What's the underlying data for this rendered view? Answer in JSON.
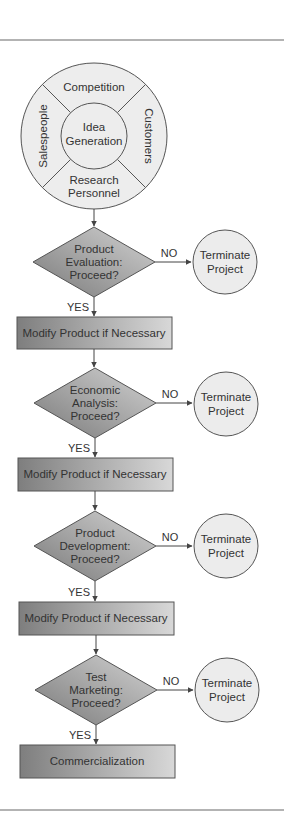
{
  "diagram": {
    "type": "flowchart",
    "colors": {
      "rule": "#9a9a9a",
      "stroke": "#555555",
      "text": "#333333",
      "circle_fill": "#ececec",
      "shape_dark": "#858585",
      "shape_light": "#d4d4d4"
    },
    "idea_wheel": {
      "center": "Idea Generation",
      "center_lines": [
        "Idea",
        "Generation"
      ],
      "segments": {
        "top": "Competition",
        "right": "Customers",
        "bottom_lines": [
          "Research",
          "Personnel"
        ],
        "left": "Salespeople"
      }
    },
    "stages": [
      {
        "decision_lines": [
          "Product",
          "Evaluation:",
          "Proceed?"
        ],
        "no_label": "NO",
        "yes_label": "YES",
        "terminate_lines": [
          "Terminate",
          "Project"
        ],
        "action": "Modify Product if Necessary"
      },
      {
        "decision_lines": [
          "Economic",
          "Analysis:",
          "Proceed?"
        ],
        "no_label": "NO",
        "yes_label": "YES",
        "terminate_lines": [
          "Terminate",
          "Project"
        ],
        "action": "Modify Product if Necessary"
      },
      {
        "decision_lines": [
          "Product",
          "Development:",
          "Proceed?"
        ],
        "no_label": "NO",
        "yes_label": "YES",
        "terminate_lines": [
          "Terminate",
          "Project"
        ],
        "action": "Modify Product if Necessary"
      },
      {
        "decision_lines": [
          "Test",
          "Marketing:",
          "Proceed?"
        ],
        "no_label": "NO",
        "yes_label": "YES",
        "terminate_lines": [
          "Terminate",
          "Project"
        ],
        "action": "Commercialization"
      }
    ]
  }
}
